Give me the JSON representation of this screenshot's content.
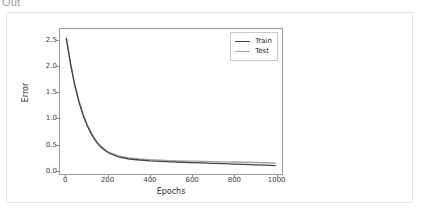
{
  "cell": {
    "out_label": "Out"
  },
  "chart_data": {
    "type": "line",
    "title": "",
    "xlabel": "Epochs",
    "ylabel": "Error",
    "xlim": [
      -30,
      1030
    ],
    "ylim": [
      -0.08,
      2.72
    ],
    "grid": false,
    "legend_position": "upper right",
    "xticks": [
      0,
      200,
      400,
      600,
      800,
      1000
    ],
    "xtick_labels": [
      "0",
      "200",
      "400",
      "600",
      "800",
      "1000"
    ],
    "yticks": [
      0.0,
      0.5,
      1.0,
      1.5,
      2.0,
      2.5
    ],
    "ytick_labels": [
      "0.0",
      "0.5",
      "1.0",
      "1.5",
      "2.0",
      "2.5"
    ],
    "colors": {
      "train": "#434343",
      "test": "#a5a5a5",
      "axis": "#9b9b9b",
      "text": "#2f2f2f"
    },
    "x": [
      0,
      20,
      40,
      60,
      80,
      100,
      120,
      140,
      160,
      180,
      200,
      250,
      300,
      350,
      400,
      450,
      500,
      550,
      600,
      650,
      700,
      750,
      800,
      850,
      900,
      950,
      1000
    ],
    "series": [
      {
        "name": "Train",
        "color": "#434343",
        "values": [
          2.55,
          2.05,
          1.64,
          1.32,
          1.06,
          0.85,
          0.69,
          0.56,
          0.46,
          0.39,
          0.33,
          0.25,
          0.21,
          0.19,
          0.175,
          0.165,
          0.155,
          0.147,
          0.14,
          0.133,
          0.126,
          0.119,
          0.112,
          0.105,
          0.098,
          0.09,
          0.082
        ]
      },
      {
        "name": "Test",
        "color": "#a5a5a5",
        "values": [
          2.55,
          2.06,
          1.66,
          1.34,
          1.08,
          0.87,
          0.71,
          0.58,
          0.48,
          0.41,
          0.35,
          0.27,
          0.23,
          0.21,
          0.197,
          0.188,
          0.18,
          0.174,
          0.169,
          0.164,
          0.16,
          0.156,
          0.152,
          0.147,
          0.142,
          0.137,
          0.132
        ]
      }
    ]
  }
}
